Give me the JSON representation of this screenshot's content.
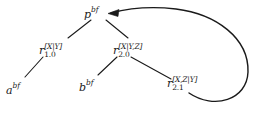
{
  "figure": {
    "background_color": "#ffffff",
    "line_color": "#1a1a1a",
    "width": 261,
    "height": 116
  },
  "nodes": {
    "p": {
      "id": "p",
      "base": "p",
      "superscript": "bf",
      "subscript": "",
      "label": "p^bf",
      "x": 95,
      "y": 12
    },
    "r10": {
      "id": "r10",
      "base": "r",
      "superscript": "[X|Y]",
      "subscript": "1.0",
      "label": "r_1.0^[X|Y]",
      "x": 52,
      "y": 50
    },
    "r20": {
      "id": "r20",
      "base": "r",
      "superscript": "[X|Y,Z]",
      "subscript": "2.0",
      "label": "r_2.0^[X|Y,Z]",
      "x": 126,
      "y": 50
    },
    "r21": {
      "id": "r21",
      "base": "r",
      "superscript": "[X,Z|Y]",
      "subscript": "2.1",
      "label": "r_2.1^[X,Z|Y]",
      "x": 180,
      "y": 83
    },
    "a": {
      "id": "a",
      "base": "a",
      "superscript": "bf",
      "subscript": "",
      "label": "a^bf",
      "x": 16,
      "y": 88
    },
    "b": {
      "id": "b",
      "base": "b",
      "superscript": "bf",
      "subscript": "",
      "label": "b^bf",
      "x": 89,
      "y": 85
    }
  },
  "edges": [
    {
      "name": "edge-p-to-r10",
      "from": "p",
      "to": "r10",
      "path": "M 91 20 L 68 38"
    },
    {
      "name": "edge-p-to-r20",
      "from": "p",
      "to": "r20",
      "path": "M 106 20 L 128 38"
    },
    {
      "name": "edge-r10-to-a",
      "from": "r10",
      "to": "a",
      "path": "M 43 57 L 25 77"
    },
    {
      "name": "edge-r20-to-b",
      "from": "r20",
      "to": "b",
      "path": "M 117 57 L 98 75"
    },
    {
      "name": "edge-r20-to-r21",
      "from": "r20",
      "to": "r21",
      "path": "M 131 57 L 171 79"
    }
  ],
  "back_arrow": {
    "name": "back-arrow-r21-to-p",
    "from": "r21",
    "to": "p",
    "path": "M 189 93 C 214 110 247 100 248 72 C 249 38 216 14 176 9 C 150 6 126 9 111 13",
    "head_at_x": 110,
    "head_at_y": 13,
    "direction": "left"
  }
}
